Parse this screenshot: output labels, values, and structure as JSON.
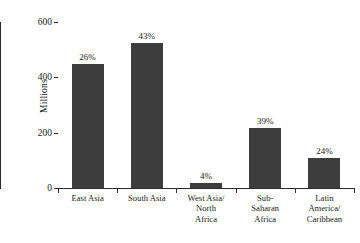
{
  "chart_data": {
    "type": "bar",
    "title": "",
    "subtitle": "",
    "xlabel": "",
    "ylabel": "Millions",
    "ylim": [
      0,
      600
    ],
    "yticks": [
      0,
      200,
      400,
      600
    ],
    "ytick_labels": [
      "0",
      "200",
      "400",
      "600"
    ],
    "grid": false,
    "legend": false,
    "bar_color": "#3d3d3d",
    "axis_color": "#2b2b2b",
    "categories": [
      "East Asia",
      "South Asia",
      "West Asia/ North Africa",
      "Sub-Saharan Africa",
      "Latin America/ Caribbean"
    ],
    "category_label_lines": [
      [
        "East Asia"
      ],
      [
        "South Asia"
      ],
      [
        "West Asia/",
        "North",
        "Africa"
      ],
      [
        "Sub-",
        "Saharan",
        "Africa"
      ],
      [
        "Latin",
        "America/",
        "Caribbean"
      ]
    ],
    "values": [
      448,
      524,
      18,
      217,
      108
    ],
    "data_labels": [
      "26%",
      "43%",
      "4%",
      "39%",
      "24%"
    ],
    "series": [
      {
        "name": "Population",
        "values": [
          448,
          524,
          18,
          217,
          108
        ]
      }
    ]
  }
}
